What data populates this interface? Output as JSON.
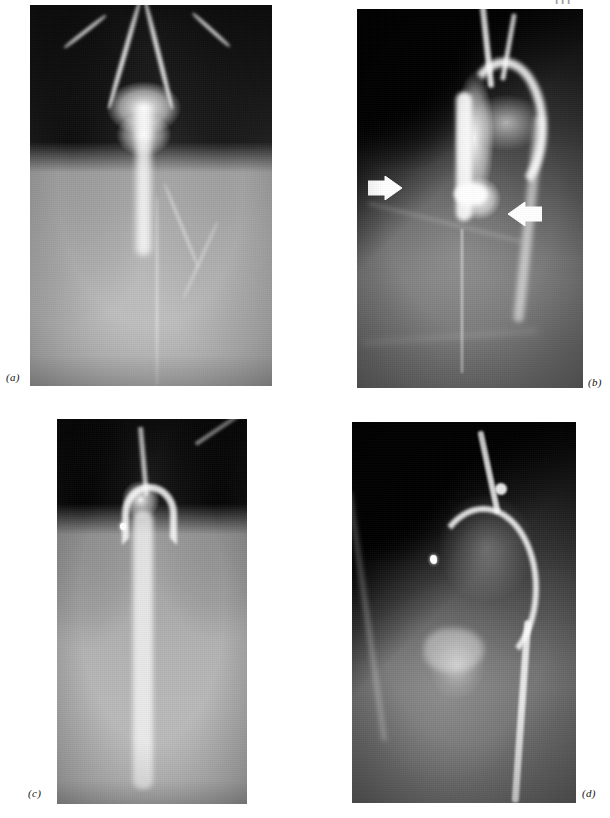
{
  "page": {
    "header_text": "111",
    "background_color": "#ffffff",
    "width": 610,
    "height": 818
  },
  "figure": {
    "type": "medical-radiograph-composite",
    "modality": "angiography / aortography",
    "panel_count": 4,
    "panels": [
      {
        "id": "a",
        "label": "(a)",
        "label_position": "bottom-left-outside",
        "view": "frontal",
        "description": "Frontal aortogram showing aortic arch, branching great vessels and descending thoracic aorta",
        "x": 30,
        "y": 5,
        "width": 242,
        "height": 381,
        "features": [
          "aortic-arch",
          "brachiocephalic-branches",
          "descending-aorta",
          "vertebral-column",
          "lung-fields"
        ],
        "arrows": []
      },
      {
        "id": "b",
        "label": "(b)",
        "label_position": "bottom-right-outside",
        "view": "lateral",
        "description": "Lateral aortogram; two white block arrows indicate the lesion at the aortic isthmus",
        "x": 357,
        "y": 9,
        "width": 226,
        "height": 379,
        "features": [
          "aortic-arch",
          "ascending-aorta",
          "descending-aorta",
          "ribs",
          "arrow-markers"
        ],
        "arrows": [
          {
            "name": "arrow-marker-left",
            "direction": "right",
            "x_pct": 22,
            "y_pct": 48,
            "color": "#ffffff"
          },
          {
            "name": "arrow-marker-right",
            "direction": "left",
            "x_pct": 72,
            "y_pct": 52,
            "color": "#ffffff"
          }
        ]
      },
      {
        "id": "c",
        "label": "(c)",
        "label_position": "bottom-left-outside",
        "view": "frontal",
        "description": "Follow-up frontal aortogram with narrowed contrast column and a radio-opaque surgical clip",
        "x": 57,
        "y": 419,
        "width": 190,
        "height": 385,
        "features": [
          "aortic-arch",
          "descending-aorta",
          "surgical-clip",
          "vertebral-column",
          "lung-fields"
        ],
        "arrows": []
      },
      {
        "id": "d",
        "label": "(d)",
        "label_position": "bottom-right-outside",
        "view": "lateral",
        "description": "Follow-up lateral aortogram with catheter in the aortic arch and a radio-opaque surgical clip",
        "x": 352,
        "y": 422,
        "width": 224,
        "height": 381,
        "features": [
          "aortic-arch",
          "catheter",
          "surgical-clip",
          "ribs",
          "diaphragm"
        ],
        "arrows": []
      }
    ]
  },
  "labels": {
    "a": "(a)",
    "b": "(b)",
    "c": "(c)",
    "d": "(d)"
  },
  "colors": {
    "page_background": "#ffffff",
    "film_black": "#1f1f1f",
    "film_midgrey": "#6e6e6e",
    "contrast_white": "#ffffff",
    "label_text": "#111111",
    "header_text": "#9a9a9a"
  }
}
